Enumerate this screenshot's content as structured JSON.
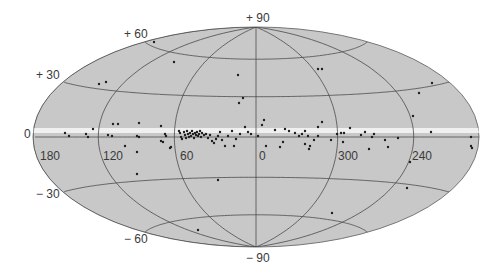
{
  "chart_data": {
    "type": "scatter",
    "projection": "aitoff-hammer (galactic coordinates)",
    "title": "",
    "xlabel": "",
    "ylabel": "",
    "background_color": "#c8c8c8",
    "grid_color": "#4a4a4a",
    "point_color": "#1e1e1e",
    "galactic_plane_band_color": "#f0f0f0",
    "latitude_labels": [
      {
        "text": "+ 90",
        "lat": 90
      },
      {
        "text": "+ 60",
        "lat": 60
      },
      {
        "text": "+ 30",
        "lat": 30
      },
      {
        "text": "0",
        "lat": 0
      },
      {
        "text": "− 30",
        "lat": -30
      },
      {
        "text": "− 60",
        "lat": -60
      },
      {
        "text": "− 90",
        "lat": -90
      }
    ],
    "longitude_labels": [
      {
        "text": "180",
        "lon": 180
      },
      {
        "text": "120",
        "lon": 120
      },
      {
        "text": "60",
        "lon": 60
      },
      {
        "text": "0",
        "lon": 0
      },
      {
        "text": "300",
        "lon": 300
      },
      {
        "text": "240",
        "lon": 240
      }
    ],
    "meridians_deg": [
      180,
      120,
      60,
      0,
      300,
      240
    ],
    "parallels_deg": [
      60,
      30,
      0,
      -30,
      -60
    ],
    "points_pixel": [
      [
        154,
        42
      ],
      [
        174,
        62
      ],
      [
        99,
        84
      ],
      [
        106,
        82
      ],
      [
        238,
        75
      ],
      [
        243,
        98
      ],
      [
        239,
        103
      ],
      [
        318,
        69
      ],
      [
        322,
        69
      ],
      [
        432,
        83
      ],
      [
        419,
        93
      ],
      [
        413,
        116
      ],
      [
        65,
        133
      ],
      [
        69,
        136
      ],
      [
        86,
        134
      ],
      [
        93,
        129
      ],
      [
        88,
        137
      ],
      [
        108,
        135
      ],
      [
        112,
        136
      ],
      [
        113,
        124
      ],
      [
        118,
        124
      ],
      [
        139,
        123
      ],
      [
        137,
        136
      ],
      [
        139,
        137
      ],
      [
        125,
        146
      ],
      [
        137,
        152
      ],
      [
        137,
        174
      ],
      [
        161,
        126
      ],
      [
        165,
        134
      ],
      [
        166,
        136
      ],
      [
        163,
        142
      ],
      [
        161,
        141
      ],
      [
        171,
        147
      ],
      [
        170,
        148
      ],
      [
        179,
        131
      ],
      [
        180,
        133
      ],
      [
        181,
        137
      ],
      [
        182,
        139
      ],
      [
        184,
        132
      ],
      [
        185,
        135
      ],
      [
        186,
        138
      ],
      [
        187,
        131
      ],
      [
        188,
        134
      ],
      [
        189,
        137
      ],
      [
        190,
        133
      ],
      [
        191,
        136
      ],
      [
        192,
        131
      ],
      [
        193,
        134
      ],
      [
        194,
        138
      ],
      [
        195,
        133
      ],
      [
        196,
        135
      ],
      [
        197,
        132
      ],
      [
        198,
        136
      ],
      [
        199,
        134
      ],
      [
        200,
        131
      ],
      [
        201,
        137
      ],
      [
        202,
        133
      ],
      [
        204,
        135
      ],
      [
        206,
        134
      ],
      [
        208,
        138
      ],
      [
        210,
        135
      ],
      [
        212,
        141
      ],
      [
        214,
        143
      ],
      [
        216,
        139
      ],
      [
        218,
        136
      ],
      [
        220,
        132
      ],
      [
        222,
        140
      ],
      [
        225,
        146
      ],
      [
        228,
        136
      ],
      [
        232,
        131
      ],
      [
        234,
        146
      ],
      [
        236,
        139
      ],
      [
        240,
        134
      ],
      [
        218,
        180
      ],
      [
        198,
        230
      ],
      [
        245,
        127
      ],
      [
        248,
        132
      ],
      [
        251,
        134
      ],
      [
        258,
        136
      ],
      [
        262,
        125
      ],
      [
        264,
        120
      ],
      [
        266,
        146
      ],
      [
        275,
        130
      ],
      [
        280,
        147
      ],
      [
        283,
        142
      ],
      [
        285,
        129
      ],
      [
        289,
        131
      ],
      [
        295,
        133
      ],
      [
        299,
        136
      ],
      [
        302,
        134
      ],
      [
        305,
        131
      ],
      [
        308,
        136
      ],
      [
        305,
        144
      ],
      [
        309,
        149
      ],
      [
        310,
        146
      ],
      [
        314,
        140
      ],
      [
        318,
        127
      ],
      [
        322,
        122
      ],
      [
        318,
        136
      ],
      [
        331,
        140
      ],
      [
        337,
        134
      ],
      [
        341,
        133
      ],
      [
        344,
        133
      ],
      [
        343,
        142
      ],
      [
        350,
        128
      ],
      [
        361,
        135
      ],
      [
        365,
        132
      ],
      [
        372,
        137
      ],
      [
        374,
        134
      ],
      [
        369,
        149
      ],
      [
        385,
        140
      ],
      [
        388,
        147
      ],
      [
        398,
        138
      ],
      [
        410,
        162
      ],
      [
        407,
        188
      ],
      [
        431,
        132
      ],
      [
        471,
        137
      ],
      [
        471,
        146
      ],
      [
        472,
        148
      ],
      [
        332,
        213
      ]
    ]
  },
  "galactic_plane_label": "0"
}
